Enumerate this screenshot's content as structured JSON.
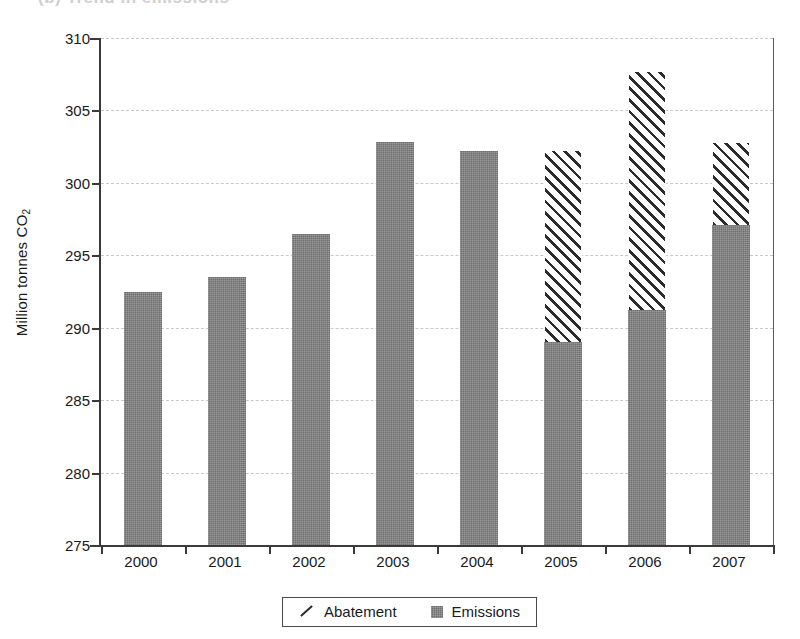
{
  "figure": {
    "cutoff_title": "(b) Trend in emissions"
  },
  "chart_data": {
    "type": "bar",
    "stacked": true,
    "title": "",
    "xlabel": "",
    "ylabel": "Million tonnes CO2",
    "ylabel_prefix": "Million tonnes CO",
    "ylabel_sub": "2",
    "categories": [
      "2000",
      "2001",
      "2002",
      "2003",
      "2004",
      "2005",
      "2006",
      "2007"
    ],
    "ylim": [
      275,
      310
    ],
    "yticks": [
      275,
      280,
      285,
      290,
      295,
      300,
      305,
      310
    ],
    "ytick_labels": [
      "275",
      "280",
      "285",
      "290",
      "295",
      "300",
      "305",
      "310"
    ],
    "grid": true,
    "legend_position": "bottom",
    "series": [
      {
        "name": "Emissions",
        "color": "#808080",
        "fill": "solid-gray",
        "values": [
          292.5,
          293.5,
          296.5,
          302.8,
          302.2,
          289.0,
          291.2,
          297.1
        ]
      },
      {
        "name": "Abatement",
        "color": "#2b2b2b",
        "fill": "diagonal-hatch",
        "values": [
          0,
          0,
          0,
          0,
          0,
          13.3,
          16.5,
          5.7
        ],
        "tops": [
          null,
          null,
          null,
          null,
          null,
          302.3,
          307.7,
          302.8
        ]
      }
    ]
  },
  "legend": {
    "entries": [
      {
        "label": "Abatement",
        "swatch": "hatch-line-icon"
      },
      {
        "label": "Emissions",
        "swatch": "gray-square-icon"
      }
    ]
  }
}
